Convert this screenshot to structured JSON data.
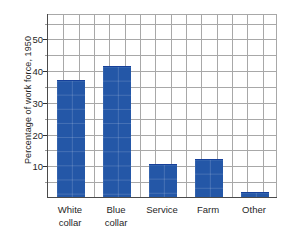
{
  "chart_data": {
    "type": "bar",
    "title": "",
    "subtitle": "",
    "xlabel": "",
    "ylabel": "Percentage of work force, 1950",
    "categories": [
      "White collar",
      "Blue collar",
      "Service",
      "Farm",
      "Other"
    ],
    "category_lines": [
      [
        "White",
        "collar"
      ],
      [
        "Blue",
        "collar"
      ],
      [
        "Service"
      ],
      [
        "Farm"
      ],
      [
        "Other"
      ]
    ],
    "values": [
      36.5,
      41.0,
      10.2,
      11.6,
      1.2
    ],
    "ylim": [
      0,
      58
    ],
    "yticks": [
      10,
      20,
      30,
      40,
      50
    ],
    "ytick_labels": [
      "10",
      "20",
      "30",
      "40",
      "50"
    ],
    "yminor_ticks": [
      5,
      15,
      25,
      35,
      45,
      55
    ],
    "grid": true,
    "grid_horizontal_values": [
      5,
      10,
      15,
      20,
      25,
      30,
      35,
      40,
      45,
      50,
      55
    ],
    "grid_vertical_count": 15,
    "legend": "none",
    "bar_color": "#2457a7",
    "bar_edge_color": "#16409a",
    "grid_color": "#a8a8a8",
    "axis_color": "#4a4a4a",
    "background_color": "#ffffff",
    "bar_width_fraction": 0.62
  }
}
